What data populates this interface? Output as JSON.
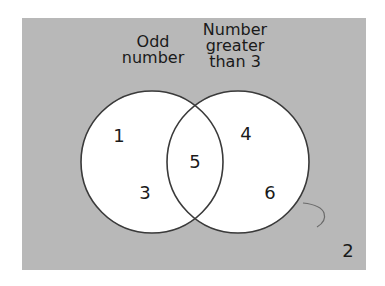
{
  "diagram": {
    "type": "venn",
    "background_color": "#b8b8b8",
    "circle_fill": "#ffffff",
    "stroke_color": "#3a3a3a",
    "sets": [
      {
        "id": "odd",
        "label_lines": [
          "Odd",
          "number"
        ],
        "label": "Odd number"
      },
      {
        "id": "gt3",
        "label_lines": [
          "Number",
          "greater",
          "than 3"
        ],
        "label": "Number greater than 3"
      }
    ],
    "regions": {
      "odd_only": [
        "1",
        "3"
      ],
      "intersection": [
        "5"
      ],
      "gt3_only": [
        "4",
        "6"
      ],
      "outside": [
        "2"
      ]
    },
    "elements": {
      "one": "1",
      "three": "3",
      "five": "5",
      "four": "4",
      "six": "6",
      "two": "2"
    }
  }
}
